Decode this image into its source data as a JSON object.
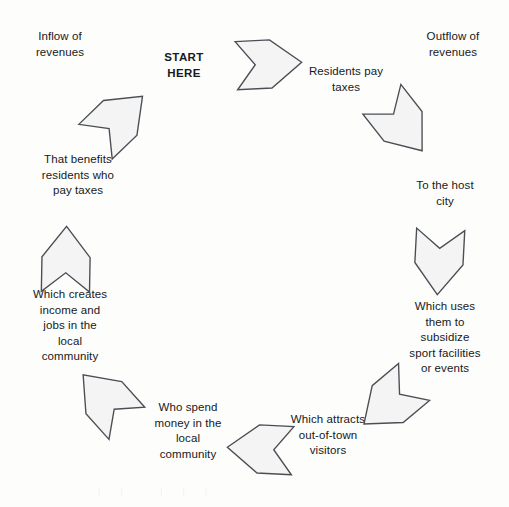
{
  "diagram": {
    "type": "cycle-flow",
    "shape": "ring",
    "direction": "clockwise",
    "arrow_count": 8,
    "colors": {
      "page_background": "#fdfdfc",
      "arrow_fill": "#f4f4f4",
      "arrow_stroke": "#4b4f55",
      "text": "#17191b"
    },
    "annotations": {
      "inflow": "Inflow of\nrevenues",
      "outflow": "Outflow of\nrevenues",
      "start": "START\nHERE"
    },
    "steps": [
      {
        "index": 1,
        "label": "Residents pay\ntaxes"
      },
      {
        "index": 2,
        "label": "To the host\ncity"
      },
      {
        "index": 3,
        "label": "Which uses\nthem to\nsubsidize\nsport facilities\nor events"
      },
      {
        "index": 4,
        "label": "Which attracts\nout-of-town\nvisitors"
      },
      {
        "index": 5,
        "label": "Who spend\nmoney in the\nlocal\ncommunity"
      },
      {
        "index": 6,
        "label": "Which creates\nincome and\njobs in the\nlocal\ncommunity"
      },
      {
        "index": 7,
        "label": "That benefits\nresidents who\npay taxes"
      }
    ],
    "arrows": [
      {
        "index": 1,
        "name": "arrow-top-center",
        "points_to": "right",
        "rotation_deg": 0
      },
      {
        "index": 2,
        "name": "arrow-top-right",
        "points_to": "down-right",
        "rotation_deg": 55
      },
      {
        "index": 3,
        "name": "arrow-right",
        "points_to": "down",
        "rotation_deg": 95
      },
      {
        "index": 4,
        "name": "arrow-bottom-right",
        "points_to": "down-left",
        "rotation_deg": 140
      },
      {
        "index": 5,
        "name": "arrow-bottom-center",
        "points_to": "left",
        "rotation_deg": 185
      },
      {
        "index": 6,
        "name": "arrow-bottom-left",
        "points_to": "up-left",
        "rotation_deg": 230
      },
      {
        "index": 7,
        "name": "arrow-left",
        "points_to": "up",
        "rotation_deg": 272
      },
      {
        "index": 8,
        "name": "arrow-top-left",
        "points_to": "up-right",
        "rotation_deg": 318
      }
    ],
    "bleed_through": "|   |      |   |   |"
  }
}
